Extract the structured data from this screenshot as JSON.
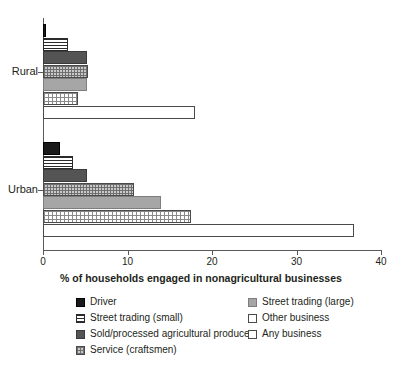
{
  "chart_data": {
    "type": "bar",
    "orientation": "horizontal",
    "title": "",
    "xlabel": "% of households engaged in nonagricultural businesses",
    "ylabel": "",
    "xlim": [
      0,
      40
    ],
    "xticks": [
      0,
      10,
      20,
      30,
      40
    ],
    "xtick_labels": [
      "0",
      "10",
      "20",
      "30",
      "40"
    ],
    "grid": false,
    "legend_position": "bottom",
    "categories": [
      "Rural",
      "Urban"
    ],
    "series": [
      {
        "name": "Driver",
        "values": [
          0.4,
          2.0
        ],
        "swatch": "solid-black"
      },
      {
        "name": "Street trading (small)",
        "values": [
          3.0,
          3.6
        ],
        "swatch": "hlines"
      },
      {
        "name": "Sold/processed agricultural produce",
        "values": [
          5.2,
          5.2
        ],
        "swatch": "darkgray"
      },
      {
        "name": "Service (craftsmen)",
        "values": [
          5.3,
          10.8
        ],
        "swatch": "checker"
      },
      {
        "name": "Street trading (large)",
        "values": [
          5.2,
          14.0
        ],
        "swatch": "midgray"
      },
      {
        "name": "Other business",
        "values": [
          4.2,
          17.5
        ],
        "swatch": "grid-fine"
      },
      {
        "name": "Any business",
        "values": [
          18.0,
          36.8
        ],
        "swatch": "white"
      }
    ]
  },
  "legend": {
    "items": [
      {
        "label": "Driver",
        "swatch": "solid-black"
      },
      {
        "label": "Street trading (large)",
        "swatch": "midgray"
      },
      {
        "label": "Street trading (small)",
        "swatch": "hlines"
      },
      {
        "label": "Other business",
        "swatch": "white"
      },
      {
        "label": "Sold/processed agricultural produce",
        "swatch": "darkgray"
      },
      {
        "label": "Any business",
        "swatch": "white"
      },
      {
        "label": "Service (craftsmen)",
        "swatch": "checker"
      }
    ]
  },
  "colors": {
    "axis": "#58595b",
    "text": "#231f20",
    "background": "#ffffff"
  }
}
